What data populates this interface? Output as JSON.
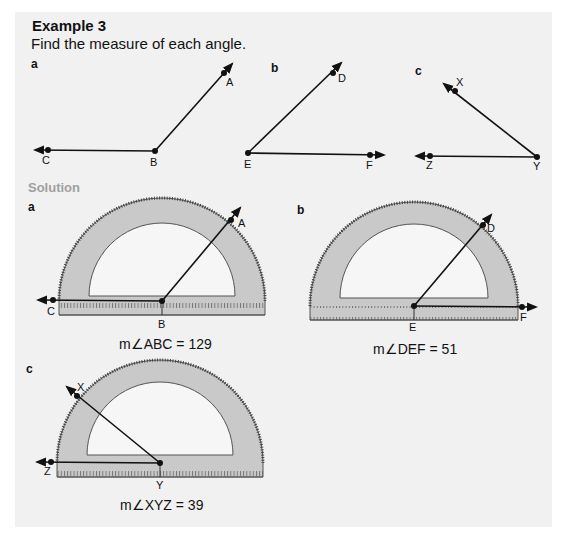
{
  "header": {
    "title": "Example 3",
    "instruction": "Find the measure of each angle."
  },
  "problems": [
    {
      "label": "a",
      "vertex": "B",
      "ray1": "A",
      "ray2": "C"
    },
    {
      "label": "b",
      "vertex": "E",
      "ray1": "D",
      "ray2": "F"
    },
    {
      "label": "c",
      "vertex": "Y",
      "ray1": "X",
      "ray2": "Z"
    }
  ],
  "solution": {
    "heading": "Solution",
    "parts": [
      {
        "label": "a",
        "points": {
          "ray_end": "A",
          "base_end": "C",
          "vertex": "B"
        },
        "result": "m∠ABC = 129"
      },
      {
        "label": "b",
        "points": {
          "ray_end": "D",
          "base_end": "F",
          "vertex": "E"
        },
        "result": "m∠DEF = 51"
      },
      {
        "label": "c",
        "points": {
          "ray_end": "X",
          "base_end": "Z",
          "vertex": "Y"
        },
        "result": "m∠XYZ = 39"
      }
    ]
  },
  "protractor": {
    "outer_scale": [
      "10",
      "20",
      "30",
      "40",
      "50",
      "60",
      "70",
      "80",
      "90",
      "100",
      "110",
      "120",
      "130",
      "140",
      "150",
      "160",
      "170"
    ],
    "inner_scale": [
      "170",
      "160",
      "150",
      "140",
      "130",
      "120",
      "110",
      "100",
      "90",
      "80",
      "70",
      "60",
      "50",
      "40",
      "30",
      "20",
      "10"
    ]
  },
  "colors": {
    "panel": "#f1f1f1",
    "protractor_fill": "#c9c9c9",
    "protractor_edge": "#555555",
    "solution_heading": "#a0a0a0",
    "ink": "#111111"
  }
}
